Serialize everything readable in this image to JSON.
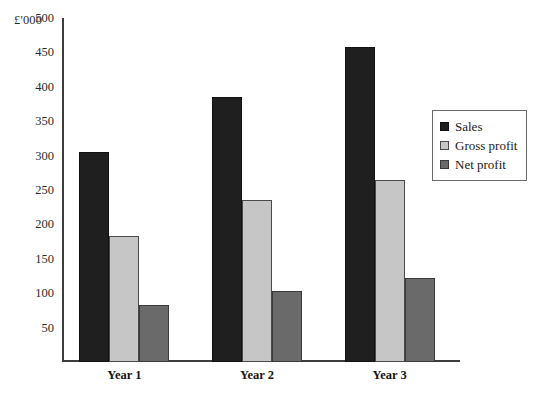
{
  "chart_data": {
    "type": "bar",
    "title": "",
    "subtitle": "",
    "unit_label": "£'000",
    "xlabel": "",
    "ylabel": "",
    "categories": [
      "Year 1",
      "Year 2",
      "Year 3"
    ],
    "series": [
      {
        "name": "Sales",
        "color": "#1f1f1f",
        "values": [
          305,
          385,
          458
        ]
      },
      {
        "name": "Gross profit",
        "color": "#c6c6c6",
        "values": [
          183,
          235,
          265
        ]
      },
      {
        "name": "Net profit",
        "color": "#6a6a6a",
        "values": [
          83,
          103,
          122
        ]
      }
    ],
    "ylim": [
      0,
      500
    ],
    "y_ticks": [
      50,
      100,
      150,
      200,
      250,
      300,
      350,
      400,
      450,
      500
    ],
    "y_tick_labels": [
      "50",
      "100",
      "150",
      "200",
      "250",
      "300",
      "350",
      "400",
      "450",
      "500"
    ],
    "grid": false,
    "legend_position": "right"
  },
  "legend": {
    "entries": [
      {
        "label": "Sales"
      },
      {
        "label": "Gross profit"
      },
      {
        "label": "Net profit"
      }
    ]
  }
}
